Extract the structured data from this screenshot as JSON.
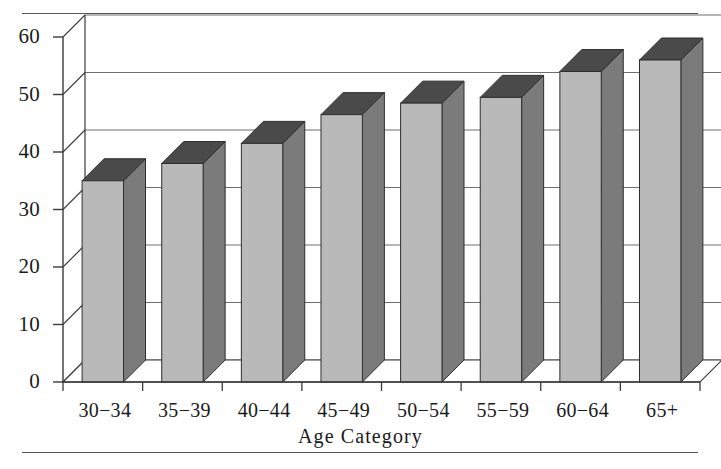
{
  "figure": {
    "background_color": "#ffffff",
    "rule_color": "#555555",
    "has_top_rule": true,
    "has_bottom_rule": true
  },
  "style": {
    "bar_front_color": "#b9b9b9",
    "bar_top_color": "#4a4a4a",
    "bar_side_color": "#7b7b7b",
    "axis_color": "#3a3a3a",
    "grid_color": "#6e6e6e",
    "floor_color": "#8f8f8f"
  },
  "chart_data": {
    "type": "bar",
    "title": "",
    "subtitle": "",
    "xlabel": "Age Category",
    "ylabel": "",
    "categories": [
      "30−34",
      "35−39",
      "40−44",
      "45−49",
      "50−54",
      "55−59",
      "60−64",
      "65+"
    ],
    "values": [
      35,
      38,
      41.5,
      46.5,
      48.5,
      49.5,
      54,
      56
    ],
    "ylim": [
      0,
      60
    ],
    "ytick_labels": [
      "0",
      "10",
      "20",
      "30",
      "40",
      "50",
      "60"
    ],
    "ytick_values": [
      0,
      10,
      20,
      30,
      40,
      50,
      60
    ],
    "grid": true,
    "grid_axis": "y",
    "legend": false,
    "legend_position": "none",
    "three_d": true,
    "series": [
      {
        "name": "Percent",
        "values": [
          35,
          38,
          41.5,
          46.5,
          48.5,
          49.5,
          54,
          56
        ]
      }
    ]
  }
}
